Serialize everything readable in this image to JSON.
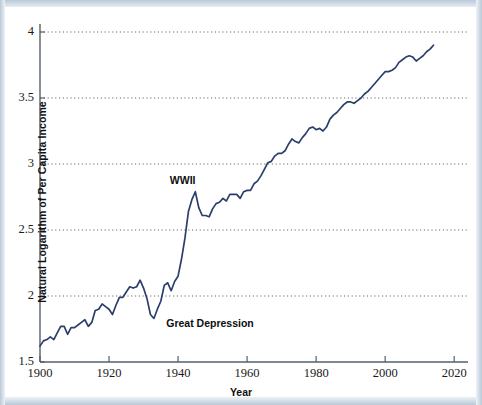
{
  "chart_data": {
    "type": "line",
    "title": "",
    "xlabel": "Year",
    "ylabel": "Natural Logarithm of Per Capita Income",
    "xlim": [
      1900,
      2024
    ],
    "ylim": [
      1.5,
      4.0
    ],
    "grid": true,
    "grid_axis": "y",
    "legend": "none",
    "line_color": "#2c3e6b",
    "x_ticks": [
      "1900",
      "1920",
      "1940",
      "1960",
      "1980",
      "2000",
      "2020"
    ],
    "x_tick_values": [
      1900,
      1920,
      1940,
      1960,
      1980,
      2000,
      2020
    ],
    "y_ticks": [
      "1.5",
      "2",
      "2.5",
      "3",
      "3.5",
      "4"
    ],
    "y_tick_values": [
      1.5,
      2.0,
      2.5,
      3.0,
      3.5,
      4.0
    ],
    "annotations": [
      {
        "label": "WWII",
        "x": 1944,
        "y": 2.86
      },
      {
        "label": "Great Depression",
        "x": 1936,
        "y": 1.79
      }
    ],
    "series": [
      {
        "name": "Natural Logarithm of Per Capita Income",
        "x": [
          1900,
          1901,
          1902,
          1903,
          1904,
          1905,
          1906,
          1907,
          1908,
          1909,
          1910,
          1911,
          1912,
          1913,
          1914,
          1915,
          1916,
          1917,
          1918,
          1919,
          1920,
          1921,
          1922,
          1923,
          1924,
          1925,
          1926,
          1927,
          1928,
          1929,
          1930,
          1931,
          1932,
          1933,
          1934,
          1935,
          1936,
          1937,
          1938,
          1939,
          1940,
          1941,
          1942,
          1943,
          1944,
          1945,
          1946,
          1947,
          1948,
          1949,
          1950,
          1951,
          1952,
          1953,
          1954,
          1955,
          1956,
          1957,
          1958,
          1959,
          1960,
          1961,
          1962,
          1963,
          1964,
          1965,
          1966,
          1967,
          1968,
          1969,
          1970,
          1971,
          1972,
          1973,
          1974,
          1975,
          1976,
          1977,
          1978,
          1979,
          1980,
          1981,
          1982,
          1983,
          1984,
          1985,
          1986,
          1987,
          1988,
          1989,
          1990,
          1991,
          1992,
          1993,
          1994,
          1995,
          1996,
          1997,
          1998,
          1999,
          2000,
          2001,
          2002,
          2003,
          2004,
          2005,
          2006,
          2007,
          2008,
          2009,
          2010,
          2011,
          2012,
          2013,
          2014
        ],
        "values": [
          1.62,
          1.66,
          1.67,
          1.69,
          1.67,
          1.72,
          1.77,
          1.77,
          1.71,
          1.76,
          1.76,
          1.78,
          1.8,
          1.82,
          1.77,
          1.8,
          1.89,
          1.9,
          1.94,
          1.92,
          1.9,
          1.86,
          1.93,
          1.99,
          1.99,
          2.03,
          2.07,
          2.06,
          2.07,
          2.12,
          2.06,
          1.98,
          1.86,
          1.83,
          1.9,
          1.96,
          2.08,
          2.1,
          2.04,
          2.11,
          2.15,
          2.28,
          2.44,
          2.64,
          2.73,
          2.79,
          2.67,
          2.61,
          2.61,
          2.6,
          2.66,
          2.7,
          2.71,
          2.74,
          2.72,
          2.77,
          2.77,
          2.77,
          2.74,
          2.79,
          2.8,
          2.8,
          2.85,
          2.87,
          2.91,
          2.96,
          3.01,
          3.02,
          3.06,
          3.08,
          3.08,
          3.1,
          3.15,
          3.19,
          3.17,
          3.16,
          3.2,
          3.23,
          3.27,
          3.28,
          3.26,
          3.27,
          3.25,
          3.28,
          3.34,
          3.37,
          3.39,
          3.42,
          3.45,
          3.47,
          3.47,
          3.46,
          3.48,
          3.5,
          3.53,
          3.55,
          3.58,
          3.61,
          3.64,
          3.67,
          3.7,
          3.7,
          3.71,
          3.73,
          3.77,
          3.79,
          3.81,
          3.82,
          3.81,
          3.78,
          3.8,
          3.82,
          3.85,
          3.87,
          3.9
        ]
      }
    ]
  },
  "axes": {
    "y_axis_title": "Natural Logarithm of Per Capita Income",
    "x_axis_title": "Year"
  }
}
